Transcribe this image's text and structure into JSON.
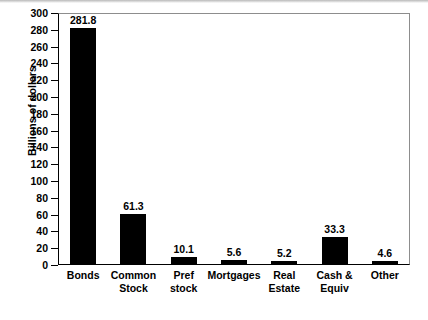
{
  "chart_data": {
    "type": "bar",
    "title": "",
    "xlabel": "",
    "ylabel": "Billions of dollars",
    "categories": [
      "Bonds",
      "Common Stock",
      "Pref stock",
      "Mortgages",
      "Real Estate",
      "Cash & Equiv",
      "Other"
    ],
    "category_lines": [
      [
        "Bonds"
      ],
      [
        "Common",
        "Stock"
      ],
      [
        "Pref",
        "stock"
      ],
      [
        "Mortgages"
      ],
      [
        "Real",
        "Estate"
      ],
      [
        "Cash &",
        "Equiv"
      ],
      [
        "Other"
      ]
    ],
    "values": [
      281.8,
      61.3,
      10.1,
      5.6,
      5.2,
      33.3,
      4.6
    ],
    "value_labels": [
      "281.8",
      "61.3",
      "10.1",
      "5.6",
      "5.2",
      "33.3",
      "4.6"
    ],
    "ylim": [
      0,
      300
    ],
    "ytick_step": 20,
    "yticks": [
      0,
      20,
      40,
      60,
      80,
      100,
      120,
      140,
      160,
      180,
      200,
      220,
      240,
      260,
      280,
      300
    ],
    "ytick_labels": [
      "0",
      "20",
      "40",
      "60",
      "80",
      "100",
      "120",
      "140",
      "160",
      "180",
      "200",
      "220",
      "240",
      "260",
      "280",
      "300"
    ],
    "grid": false,
    "legend": false,
    "legend_position": "none",
    "bar_color": "#000000",
    "axis_color": "#000000",
    "background_color": "#ffffff"
  }
}
